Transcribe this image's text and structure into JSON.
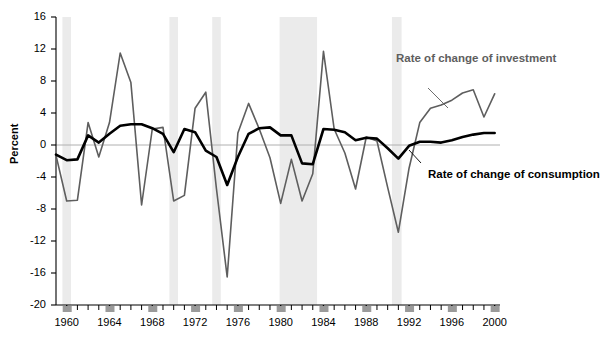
{
  "figure": {
    "title": "",
    "ylabel": "Percent",
    "xlabel": ""
  },
  "annotations": {
    "investment": {
      "line1": "Rate of",
      "line2": "change of",
      "line3": "investment",
      "color": "#5e5e5e"
    },
    "consumption": {
      "line1": "Rate of",
      "line2": "change of",
      "line3": "consumption",
      "color": "#000000"
    }
  },
  "chart_data": {
    "type": "line",
    "title": "",
    "xlabel": "",
    "ylabel": "Percent",
    "xlim": [
      1959,
      2000.5
    ],
    "ylim": [
      -20,
      16
    ],
    "yticks": [
      16,
      12,
      8,
      4,
      0,
      -4,
      -8,
      -12,
      -16,
      -20
    ],
    "ytick_labels": [
      "16",
      "12",
      "8",
      "4",
      "0",
      "-4",
      "-8",
      "-12",
      "-16",
      "-20"
    ],
    "xticks": [
      1960,
      1964,
      1968,
      1972,
      1976,
      1980,
      1984,
      1988,
      1992,
      1996,
      2000
    ],
    "xtick_labels": [
      "1960",
      "1964",
      "1968",
      "1972",
      "1976",
      "1980",
      "1984",
      "1988",
      "1992",
      "1996",
      "2000"
    ],
    "minor_xticks_every": 1,
    "grid": false,
    "zero_line": true,
    "zero_line_color": "#b0b0b0",
    "legend": "inline-annotations",
    "legend_position": "right",
    "recession_bands": [
      {
        "start": 1959.6,
        "end": 1960.4,
        "color": "#ebebeb"
      },
      {
        "start": 1969.6,
        "end": 1970.4,
        "color": "#ebebeb"
      },
      {
        "start": 1973.6,
        "end": 1974.4,
        "color": "#ebebeb"
      },
      {
        "start": 1979.9,
        "end": 1983.4,
        "color": "#ebebeb"
      },
      {
        "start": 1990.4,
        "end": 1991.3,
        "color": "#ebebeb"
      }
    ],
    "x": [
      1959,
      1960,
      1961,
      1962,
      1963,
      1964,
      1965,
      1966,
      1967,
      1968,
      1969,
      1970,
      1971,
      1972,
      1973,
      1974,
      1975,
      1976,
      1977,
      1978,
      1979,
      1980,
      1981,
      1982,
      1983,
      1984,
      1985,
      1986,
      1987,
      1988,
      1989,
      1990,
      1991,
      1992,
      1993,
      1994,
      1995,
      1996,
      1997,
      1998,
      1999,
      2000
    ],
    "series": [
      {
        "name": "Rate of change of investment",
        "color": "#5e5e5e",
        "width": 1.6,
        "values": [
          -1.3,
          -7.0,
          -6.9,
          2.8,
          -1.5,
          2.8,
          11.5,
          7.8,
          -7.5,
          2.0,
          2.2,
          -7.0,
          -6.3,
          4.6,
          6.6,
          -5.5,
          -16.5,
          1.5,
          5.2,
          2.0,
          -1.6,
          -7.3,
          -1.8,
          -7.0,
          -3.6,
          11.7,
          2.0,
          -1.0,
          -5.5,
          1.0,
          0.5,
          -5.3,
          -10.9,
          -2.9,
          2.8,
          4.6,
          5.0,
          5.6,
          6.5,
          6.9,
          3.5,
          6.4
        ]
      },
      {
        "name": "Rate of change of consumption",
        "color": "#000000",
        "width": 2.6,
        "values": [
          -1.2,
          -1.9,
          -1.8,
          1.2,
          0.3,
          1.4,
          2.4,
          2.6,
          2.6,
          2.1,
          1.4,
          -0.9,
          2.0,
          1.6,
          -0.7,
          -1.5,
          -5.0,
          -1.5,
          1.4,
          2.1,
          2.2,
          1.2,
          1.2,
          -2.3,
          -2.4,
          2.0,
          1.9,
          1.6,
          0.6,
          0.9,
          0.8,
          -0.4,
          -1.7,
          -0.1,
          0.4,
          0.4,
          0.3,
          0.6,
          1.0,
          1.3,
          1.5,
          1.5
        ]
      }
    ]
  }
}
